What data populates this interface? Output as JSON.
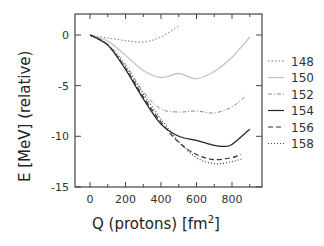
{
  "chart_data": {
    "type": "line",
    "title": "",
    "xlabel": "Q (protons) [fm",
    "xlabel_sup": "2",
    "xlabel_end": "]",
    "ylabel": "E [MeV] (relative)",
    "xlim": [
      -80,
      970
    ],
    "ylim": [
      -15,
      2
    ],
    "x_ticks": [
      0,
      200,
      400,
      600,
      800
    ],
    "x_tick_labels": [
      "0",
      "200",
      "400",
      "600",
      "800"
    ],
    "y_ticks": [
      0,
      -5,
      -10,
      -15
    ],
    "y_tick_labels": [
      "0",
      "-5",
      "-10",
      "-15"
    ],
    "grid": false,
    "legend_position": "right",
    "series": [
      {
        "name": "148",
        "style": "dotted-fine",
        "color": "#777777",
        "x": [
          0,
          100,
          200,
          300,
          400,
          500
        ],
        "y": [
          0,
          -0.3,
          -0.55,
          -0.7,
          -0.2,
          0.9
        ]
      },
      {
        "name": "150",
        "style": "solid-light",
        "color": "#c4c4c4",
        "x": [
          0,
          100,
          200,
          300,
          400,
          500,
          600,
          700,
          800,
          900
        ],
        "y": [
          0,
          -0.6,
          -2.0,
          -3.5,
          -4.2,
          -3.8,
          -4.3,
          -3.6,
          -2.2,
          -0.2
        ]
      },
      {
        "name": "152",
        "style": "dash-dot",
        "color": "#888888",
        "x": [
          0,
          100,
          200,
          300,
          400,
          500,
          600,
          700,
          800,
          880
        ],
        "y": [
          0,
          -0.9,
          -2.9,
          -5.6,
          -7.3,
          -7.6,
          -7.5,
          -7.7,
          -7.1,
          -6.0
        ]
      },
      {
        "name": "154",
        "style": "solid",
        "color": "#222222",
        "x": [
          0,
          100,
          200,
          300,
          400,
          500,
          600,
          700,
          750,
          800,
          900
        ],
        "y": [
          0,
          -1.0,
          -3.4,
          -6.3,
          -8.8,
          -10.0,
          -10.4,
          -10.9,
          -11.0,
          -10.8,
          -9.3
        ]
      },
      {
        "name": "156",
        "style": "dashed",
        "color": "#333333",
        "x": [
          0,
          100,
          200,
          300,
          400,
          500,
          600,
          700,
          800,
          850
        ],
        "y": [
          0,
          -1.0,
          -3.3,
          -6.1,
          -8.6,
          -10.6,
          -11.8,
          -12.3,
          -12.1,
          -11.8
        ]
      },
      {
        "name": "158",
        "style": "dotted",
        "color": "#444444",
        "x": [
          0,
          100,
          200,
          300,
          400,
          500,
          600,
          700,
          800,
          860
        ],
        "y": [
          0,
          -1.0,
          -3.1,
          -5.8,
          -8.3,
          -10.5,
          -12.1,
          -12.7,
          -12.5,
          -12.2
        ]
      }
    ]
  }
}
